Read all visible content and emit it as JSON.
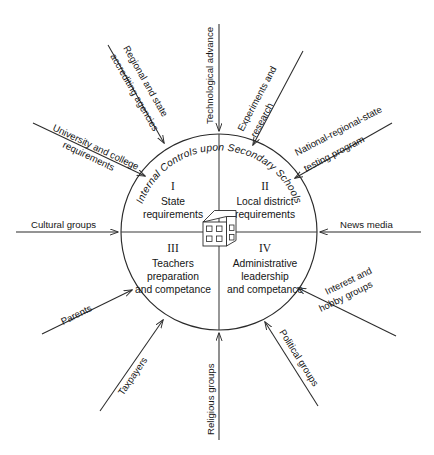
{
  "figure": {
    "arc_title": "Internal Controls upon Secondary Schools",
    "center_icon": "schoolhouse-icon",
    "quadrants": [
      {
        "numeral": "I",
        "lines": [
          "State",
          "requirements"
        ],
        "position": "upper-left"
      },
      {
        "numeral": "II",
        "lines": [
          "Local district",
          "requirements"
        ],
        "position": "upper-right"
      },
      {
        "numeral": "III",
        "lines": [
          "Teachers",
          "preparation",
          "and competance"
        ],
        "position": "lower-left"
      },
      {
        "numeral": "IV",
        "lines": [
          "Administrative",
          "leadership",
          "and competance"
        ],
        "position": "lower-right"
      }
    ],
    "external_forces": [
      {
        "name": "university-and-college-requirements",
        "lines": [
          "University and college",
          "requirements"
        ],
        "angle_deg": 208
      },
      {
        "name": "regional-and-state-accrediting-agencies",
        "lines": [
          "Regional and state",
          "accrediting agencies"
        ],
        "angle_deg": 233
      },
      {
        "name": "technological-advance",
        "lines": [
          "Technological advance"
        ],
        "angle_deg": 270
      },
      {
        "name": "experiments-and-research",
        "lines": [
          "Experiments and",
          "research"
        ],
        "angle_deg": 307
      },
      {
        "name": "national-regional-state-testing-program",
        "lines": [
          "National-regional-state",
          "testing program"
        ],
        "angle_deg": 332
      },
      {
        "name": "news-media",
        "lines": [
          "News media"
        ],
        "angle_deg": 0
      },
      {
        "name": "interest-and-hobby-groups",
        "lines": [
          "Interest and",
          "hobby groups"
        ],
        "angle_deg": 28
      },
      {
        "name": "political-groups",
        "lines": [
          "Political groups"
        ],
        "angle_deg": 59
      },
      {
        "name": "religious-groups",
        "lines": [
          "Religious groups"
        ],
        "angle_deg": 90
      },
      {
        "name": "taxpayers",
        "lines": [
          "Taxpayers"
        ],
        "angle_deg": 118
      },
      {
        "name": "parents",
        "lines": [
          "Parents"
        ],
        "angle_deg": 150
      },
      {
        "name": "cultural-groups",
        "lines": [
          "Cultural groups"
        ],
        "angle_deg": 180
      }
    ],
    "colors": {
      "stroke": "#2b2b2b",
      "text": "#151515",
      "background": "#ffffff"
    }
  }
}
